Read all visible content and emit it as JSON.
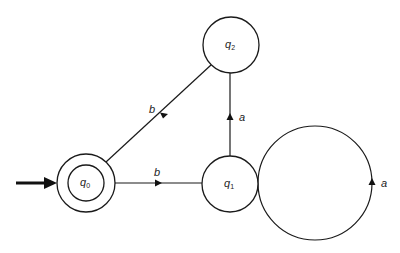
{
  "diagram": {
    "type": "finite-automaton",
    "start_state": "q0",
    "states": [
      {
        "id": "q0",
        "name": "q",
        "subscript": "0",
        "accepting": true,
        "cx": 86,
        "cy": 183,
        "r": 29
      },
      {
        "id": "q1",
        "name": "q",
        "subscript": "1",
        "accepting": false,
        "cx": 230,
        "cy": 184,
        "r": 28
      },
      {
        "id": "q2",
        "name": "q",
        "subscript": "2",
        "accepting": false,
        "cx": 231,
        "cy": 45,
        "r": 28
      }
    ],
    "transitions": [
      {
        "from": "q0",
        "to": "q1",
        "symbol": "b"
      },
      {
        "from": "q1",
        "to": "q2",
        "symbol": "a"
      },
      {
        "from": "q2",
        "to": "q0",
        "symbol": "b"
      },
      {
        "from": "q1",
        "to": "q1",
        "symbol": "a"
      }
    ],
    "labels": {
      "q0_name": "q",
      "q0_sub": "0",
      "q1_name": "q",
      "q1_sub": "1",
      "q2_name": "q",
      "q2_sub": "2",
      "edge_q0_q1": "b",
      "edge_q1_q2": "a",
      "edge_q2_q0": "b",
      "edge_q1_loop": "a"
    },
    "colors": {
      "stroke": "#1a1a1a",
      "background": "#ffffff"
    }
  }
}
